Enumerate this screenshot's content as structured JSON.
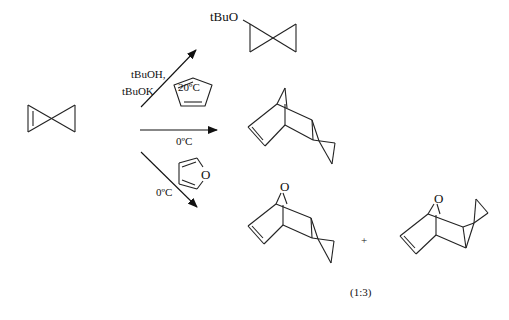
{
  "diagram": {
    "type": "chemical-reaction-scheme",
    "reactant": {
      "name": "spiro[2.2]pent-1-ene"
    },
    "reactions": [
      {
        "id": "top",
        "reagents_line1": "tBuOH,",
        "reagents_line2": "tBuOK",
        "condition": "20ºC",
        "product_label": "tBuO"
      },
      {
        "id": "middle",
        "reagent": "cyclopentadiene",
        "condition": "0ºC"
      },
      {
        "id": "bottom",
        "reagent": "furan",
        "reagent_atom": "O",
        "condition": "0ºC",
        "product1_atom": "O",
        "product2_atom": "O",
        "plus": "+",
        "ratio": "(1:3)"
      }
    ]
  }
}
